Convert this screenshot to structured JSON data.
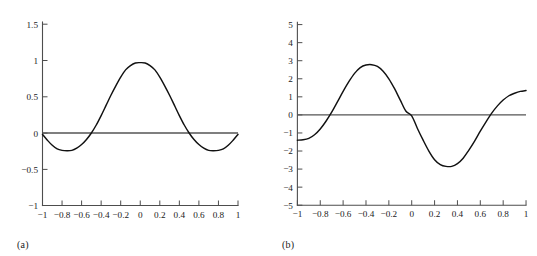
{
  "figure": {
    "background_color": "#ffffff",
    "curve_color": "#111111",
    "axis_color": "#4d4d4d",
    "zero_line_color": "#555555"
  },
  "panels": [
    {
      "caption": "(a)",
      "chart_data": {
        "type": "line",
        "title": "",
        "xlabel": "",
        "ylabel": "",
        "xlim": [
          -1,
          1
        ],
        "ylim": [
          -1,
          1.5
        ],
        "grid": false,
        "legend": null,
        "x_ticks": [
          -1,
          -0.8,
          -0.6,
          -0.4,
          -0.2,
          0,
          0.2,
          0.4,
          0.6,
          0.8,
          1
        ],
        "x_tick_labels": [
          "−1",
          "−0.8",
          "−0.6",
          "−0.4",
          "−0.2",
          "0",
          "0.2",
          "0.4",
          "0.6",
          "0.8",
          "1"
        ],
        "y_ticks": [
          -1,
          -0.5,
          0,
          0.5,
          1,
          1.5
        ],
        "y_tick_labels": [
          "−1",
          "−0.5",
          "0",
          "0.5",
          "1",
          "1.5"
        ],
        "series": [
          {
            "name": "zero-reference",
            "style": "horizontal-line",
            "value": 0
          },
          {
            "name": "curve",
            "style": "solid",
            "x": [
              -1,
              -0.95,
              -0.9,
              -0.85,
              -0.8,
              -0.75,
              -0.7,
              -0.65,
              -0.6,
              -0.55,
              -0.5,
              -0.45,
              -0.4,
              -0.35,
              -0.3,
              -0.25,
              -0.2,
              -0.15,
              -0.1,
              -0.05,
              0,
              0.05,
              0.1,
              0.15,
              0.2,
              0.25,
              0.3,
              0.35,
              0.4,
              0.45,
              0.5,
              0.55,
              0.6,
              0.65,
              0.7,
              0.75,
              0.8,
              0.85,
              0.9,
              0.95,
              1
            ],
            "values": [
              -0.02,
              -0.1,
              -0.17,
              -0.22,
              -0.24,
              -0.245,
              -0.24,
              -0.21,
              -0.16,
              -0.09,
              0.0,
              0.11,
              0.24,
              0.38,
              0.52,
              0.65,
              0.77,
              0.87,
              0.93,
              0.965,
              0.97,
              0.965,
              0.93,
              0.87,
              0.77,
              0.65,
              0.52,
              0.38,
              0.24,
              0.11,
              0.0,
              -0.09,
              -0.16,
              -0.21,
              -0.24,
              -0.245,
              -0.24,
              -0.22,
              -0.17,
              -0.1,
              -0.02
            ]
          }
        ]
      }
    },
    {
      "caption": "(b)",
      "chart_data": {
        "type": "line",
        "title": "",
        "xlabel": "",
        "ylabel": "",
        "xlim": [
          -1,
          1
        ],
        "ylim": [
          -5,
          5
        ],
        "grid": false,
        "legend": null,
        "x_ticks": [
          -1,
          -0.8,
          -0.6,
          -0.4,
          -0.2,
          0,
          0.2,
          0.4,
          0.6,
          0.8,
          1
        ],
        "x_tick_labels": [
          "−1",
          "−0.8",
          "−0.6",
          "−0.4",
          "−0.2",
          "0",
          "0.2",
          "0.4",
          "0.6",
          "0.8",
          "1"
        ],
        "y_ticks": [
          -5,
          -4,
          -3,
          -2,
          -1,
          0,
          1,
          2,
          3,
          4,
          5
        ],
        "y_tick_labels": [
          "−5",
          "−4",
          "−3",
          "−2",
          "−1",
          "0",
          "1",
          "2",
          "3",
          "4",
          "5"
        ],
        "series": [
          {
            "name": "zero-reference",
            "style": "horizontal-line",
            "value": 0
          },
          {
            "name": "curve",
            "style": "solid",
            "x": [
              -1,
              -0.95,
              -0.9,
              -0.85,
              -0.8,
              -0.75,
              -0.7,
              -0.65,
              -0.6,
              -0.55,
              -0.5,
              -0.45,
              -0.4,
              -0.35,
              -0.3,
              -0.25,
              -0.2,
              -0.15,
              -0.1,
              -0.05,
              0,
              0.05,
              0.1,
              0.15,
              0.2,
              0.25,
              0.3,
              0.35,
              0.4,
              0.45,
              0.5,
              0.55,
              0.6,
              0.65,
              0.7,
              0.75,
              0.8,
              0.85,
              0.9,
              0.95,
              1
            ],
            "values": [
              -1.4,
              -1.38,
              -1.3,
              -1.1,
              -0.78,
              -0.35,
              0.15,
              0.72,
              1.3,
              1.84,
              2.3,
              2.62,
              2.76,
              2.78,
              2.68,
              2.42,
              2.0,
              1.45,
              0.82,
              0.2,
              -0.05,
              -0.75,
              -1.4,
              -2.0,
              -2.48,
              -2.75,
              -2.85,
              -2.85,
              -2.7,
              -2.4,
              -1.95,
              -1.45,
              -0.9,
              -0.38,
              0.1,
              0.5,
              0.82,
              1.06,
              1.2,
              1.3,
              1.35
            ]
          }
        ]
      }
    }
  ]
}
